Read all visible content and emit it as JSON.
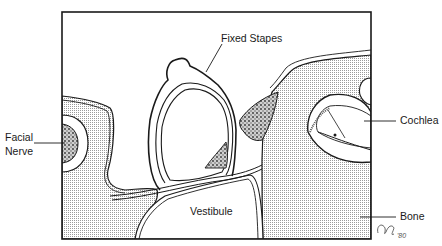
{
  "figure": {
    "labels": {
      "fixed_stapes": "Fixed Stapes",
      "cochlea": "Cochlea",
      "facial_nerve_line1": "Facial",
      "facial_nerve_line2": "Nerve",
      "vestibule": "Vestibule",
      "bone": "Bone"
    },
    "signature": "'80",
    "colors": {
      "ink": "#1a1a1a",
      "bone_fill": "#d9d9d9",
      "background": "#ffffff"
    }
  }
}
